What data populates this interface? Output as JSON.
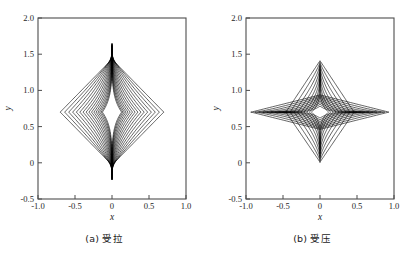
{
  "figure": {
    "panels": [
      {
        "id": "panel-a",
        "caption": "(a) 受拉",
        "caption_meaning": "tension",
        "xlabel": "x",
        "ylabel": "y"
      },
      {
        "id": "panel-b",
        "caption": "(b) 受压",
        "caption_meaning": "compression",
        "xlabel": "x",
        "ylabel": "y"
      }
    ],
    "xticklabels": [
      "-1.0",
      "-0.5",
      "0",
      "0.5",
      "1.0"
    ],
    "yticklabels": [
      "-0.5",
      "0",
      "0.5",
      "1.0",
      "1.5",
      "2.0"
    ],
    "line_color": "#000000",
    "frame_color": "#4d4d4d",
    "background_color": "#ffffff"
  },
  "chart_data": [
    {
      "type": "line",
      "id": "panel-a",
      "title": "(a) 受拉",
      "xlabel": "x",
      "ylabel": "y",
      "xlim": [
        -1.0,
        1.0
      ],
      "ylim": [
        -0.5,
        2.0
      ],
      "xticks": [
        -1.0,
        -0.5,
        0,
        0.5,
        1.0
      ],
      "yticks": [
        -0.5,
        0,
        0.5,
        1.0,
        1.5,
        2.0
      ],
      "grid": false,
      "legend": false,
      "description": "Family of nested closed curves (deformed diamonds) centred at (0, 0.70). Outer members are near-rhombic; inner members pinch toward the vertical axis forming a sharp vertical spindle. Curves are drawn as x = ±a*(1-|t|)^p, y = 0.70 + s*t with increasing concavity.",
      "center": [
        0.0,
        0.7
      ],
      "n_curves": 16,
      "series": [
        {
          "name": "c1",
          "half_width": 0.7,
          "y_top": 1.43,
          "y_bottom": -0.03,
          "shape_exp": 1.0
        },
        {
          "name": "c2",
          "half_width": 0.64,
          "y_top": 1.455,
          "y_bottom": -0.055,
          "shape_exp": 1.1
        },
        {
          "name": "c3",
          "half_width": 0.585,
          "y_top": 1.48,
          "y_bottom": -0.08,
          "shape_exp": 1.22
        },
        {
          "name": "c4",
          "half_width": 0.532,
          "y_top": 1.502,
          "y_bottom": -0.102,
          "shape_exp": 1.35
        },
        {
          "name": "c5",
          "half_width": 0.482,
          "y_top": 1.522,
          "y_bottom": -0.122,
          "shape_exp": 1.5
        },
        {
          "name": "c6",
          "half_width": 0.435,
          "y_top": 1.54,
          "y_bottom": -0.14,
          "shape_exp": 1.66
        },
        {
          "name": "c7",
          "half_width": 0.391,
          "y_top": 1.556,
          "y_bottom": -0.156,
          "shape_exp": 1.84
        },
        {
          "name": "c8",
          "half_width": 0.35,
          "y_top": 1.572,
          "y_bottom": -0.172,
          "shape_exp": 2.04
        },
        {
          "name": "c9",
          "half_width": 0.312,
          "y_top": 1.586,
          "y_bottom": -0.186,
          "shape_exp": 2.26
        },
        {
          "name": "c10",
          "half_width": 0.277,
          "y_top": 1.598,
          "y_bottom": -0.198,
          "shape_exp": 2.5
        },
        {
          "name": "c11",
          "half_width": 0.245,
          "y_top": 1.61,
          "y_bottom": -0.208,
          "shape_exp": 2.78
        },
        {
          "name": "c12",
          "half_width": 0.216,
          "y_top": 1.62,
          "y_bottom": -0.216,
          "shape_exp": 3.1
        },
        {
          "name": "c13",
          "half_width": 0.19,
          "y_top": 1.63,
          "y_bottom": -0.222,
          "shape_exp": 3.46
        },
        {
          "name": "c14",
          "half_width": 0.167,
          "y_top": 1.638,
          "y_bottom": -0.226,
          "shape_exp": 3.88
        },
        {
          "name": "c15",
          "half_width": 0.147,
          "y_top": 1.645,
          "y_bottom": -0.23,
          "shape_exp": 4.36
        },
        {
          "name": "c16",
          "half_width": 0.13,
          "y_top": 1.652,
          "y_bottom": -0.232,
          "shape_exp": 4.92
        }
      ]
    },
    {
      "type": "line",
      "id": "panel-b",
      "title": "(b) 受压",
      "xlabel": "x",
      "ylabel": "y",
      "xlim": [
        -1.0,
        1.0
      ],
      "ylim": [
        -0.5,
        2.0
      ],
      "xticks": [
        -1.0,
        -0.5,
        0,
        0.5,
        1.0
      ],
      "yticks": [
        -0.5,
        0,
        0.5,
        1.0,
        1.5,
        2.0
      ],
      "grid": false,
      "legend": false,
      "description": "Two interleaved families of closed curves centred at (0, 0.70). Family V is tall and narrow (vertical spindles, outer member a rhombus reaching y=1.41 and y=0.01 at x=0, half-width 0.46). Family H is wide and flat (horizontal lens shapes, outer member reaching x=±0.93, half-height 0.24) forming dense clusters near x=±0.55.",
      "center": [
        0.0,
        0.7
      ],
      "n_curves_vertical": 9,
      "n_curves_horizontal": 9,
      "series_vertical": [
        {
          "name": "v1",
          "half_width": 0.46,
          "y_top": 1.41,
          "y_bottom": 0.01,
          "shape_exp": 1.0
        },
        {
          "name": "v2",
          "half_width": 0.405,
          "y_top": 1.39,
          "y_bottom": 0.03,
          "shape_exp": 1.18
        },
        {
          "name": "v3",
          "half_width": 0.352,
          "y_top": 1.368,
          "y_bottom": 0.052,
          "shape_exp": 1.4
        },
        {
          "name": "v4",
          "half_width": 0.303,
          "y_top": 1.344,
          "y_bottom": 0.076,
          "shape_exp": 1.66
        },
        {
          "name": "v5",
          "half_width": 0.258,
          "y_top": 1.318,
          "y_bottom": 0.102,
          "shape_exp": 1.98
        },
        {
          "name": "v6",
          "half_width": 0.216,
          "y_top": 1.288,
          "y_bottom": 0.132,
          "shape_exp": 2.36
        },
        {
          "name": "v7",
          "half_width": 0.178,
          "y_top": 1.252,
          "y_bottom": 0.168,
          "shape_exp": 2.82
        },
        {
          "name": "v8",
          "half_width": 0.144,
          "y_top": 1.206,
          "y_bottom": 0.214,
          "shape_exp": 3.38
        },
        {
          "name": "v9",
          "half_width": 0.114,
          "y_top": 1.144,
          "y_bottom": 0.276,
          "shape_exp": 4.05
        }
      ],
      "series_horizontal": [
        {
          "name": "h1",
          "half_length": 0.93,
          "half_height": 0.238,
          "shape_exp": 1.0
        },
        {
          "name": "h2",
          "half_length": 0.876,
          "half_height": 0.222,
          "shape_exp": 1.18
        },
        {
          "name": "h3",
          "half_length": 0.822,
          "half_height": 0.206,
          "shape_exp": 1.4
        },
        {
          "name": "h4",
          "half_length": 0.768,
          "half_height": 0.189,
          "shape_exp": 1.66
        },
        {
          "name": "h5",
          "half_length": 0.714,
          "half_height": 0.171,
          "shape_exp": 1.98
        },
        {
          "name": "h6",
          "half_length": 0.66,
          "half_height": 0.152,
          "shape_exp": 2.36
        },
        {
          "name": "h7",
          "half_length": 0.606,
          "half_height": 0.131,
          "shape_exp": 2.82
        },
        {
          "name": "h8",
          "half_length": 0.552,
          "half_height": 0.108,
          "shape_exp": 3.38
        },
        {
          "name": "h9",
          "half_length": 0.5,
          "half_height": 0.082,
          "shape_exp": 4.05
        }
      ]
    }
  ]
}
